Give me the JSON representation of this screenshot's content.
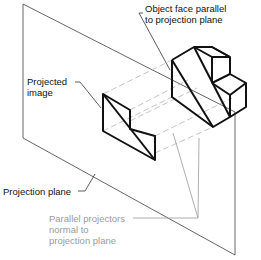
{
  "diagram": {
    "colors": {
      "object_stroke": "#111111",
      "plane_stroke": "#555555",
      "projector_stroke": "#b8b8b8",
      "label_text": "#111111",
      "projector_label_text": "#9a9a9a"
    },
    "labels": {
      "object_face": [
        "Object face parallel",
        "to projection plane"
      ],
      "projected_image": [
        "Projected",
        "image"
      ],
      "projection_plane": [
        "Projection plane"
      ],
      "parallel_projectors": [
        "Parallel projectors",
        "normal to",
        "projection plane"
      ]
    }
  }
}
